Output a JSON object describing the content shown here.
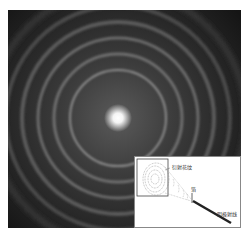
{
  "figure": {
    "colors": {
      "background": "#1a1a1a",
      "ring": "#8a8a8a",
      "center": "#ffffff"
    }
  },
  "inset": {
    "labels": {
      "pattern": "衍射花纹",
      "foil": "箔",
      "beam": "阴极射线"
    }
  }
}
